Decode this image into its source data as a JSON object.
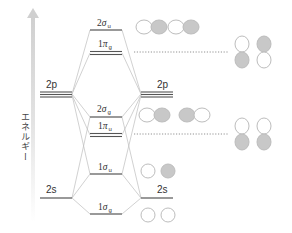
{
  "diagram": {
    "type": "molecular-orbital-energy-diagram",
    "axis": {
      "label": "エネルギー",
      "direction": "up"
    },
    "atomic_orbitals": {
      "left": [
        {
          "label": "2p",
          "degeneracy": 3
        },
        {
          "label": "2s",
          "degeneracy": 1
        }
      ],
      "right": [
        {
          "label": "2p",
          "degeneracy": 3
        },
        {
          "label": "2s",
          "degeneracy": 1
        }
      ]
    },
    "molecular_orbitals": [
      {
        "id": "2sigma_u",
        "num": "2",
        "sym": "σ",
        "sub": "u",
        "degeneracy": 1,
        "orbital_pictures": "p-sigma-antibonding"
      },
      {
        "id": "1pi_g",
        "num": "1",
        "sym": "π",
        "sub": "g",
        "degeneracy": 2,
        "orbital_pictures": "p-pi-antibonding"
      },
      {
        "id": "2sigma_g",
        "num": "2",
        "sym": "σ",
        "sub": "g",
        "degeneracy": 1,
        "orbital_pictures": "p-sigma-bonding"
      },
      {
        "id": "1pi_u",
        "num": "1",
        "sym": "π",
        "sub": "u",
        "degeneracy": 2,
        "orbital_pictures": "p-pi-bonding"
      },
      {
        "id": "1sigma_u",
        "num": "1",
        "sym": "σ",
        "sub": "u",
        "degeneracy": 1,
        "orbital_pictures": "s-antibonding"
      },
      {
        "id": "1sigma_g",
        "num": "1",
        "sym": "σ",
        "sub": "g",
        "degeneracy": 1,
        "orbital_pictures": "s-bonding"
      }
    ],
    "colors": {
      "level_line": "#555555",
      "connector": "#bbbbbb",
      "lobe_fill": "#c8c8c8",
      "lobe_stroke": "#bdbdbd",
      "arrow": "#d9d9d9",
      "dotted": "#777777"
    }
  }
}
